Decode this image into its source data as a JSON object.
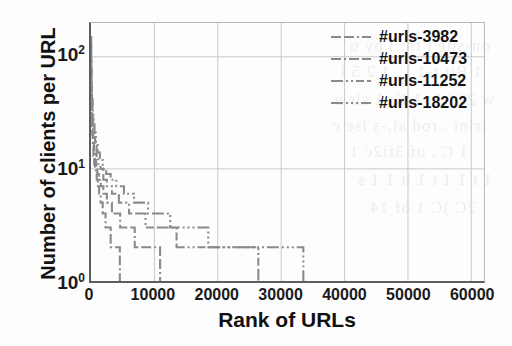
{
  "figure": {
    "background_color": "#fdfdfd",
    "axis_color": "#5e5e5e",
    "grid_color": "#c9c9c9",
    "line_color": "#8a8a8a"
  },
  "axes": {
    "xlabel": "Rank of URLs",
    "ylabel": "Number of clients per URL",
    "xticks": [
      "0",
      "10000",
      "20000",
      "30000",
      "40000",
      "50000",
      "60000"
    ],
    "xtick_values": [
      0,
      10000,
      20000,
      30000,
      40000,
      50000,
      60000
    ],
    "yticks": [
      "10",
      "10",
      "10"
    ],
    "ytick_exponents": [
      "0",
      "1",
      "2"
    ],
    "ytick_values": [
      1,
      10,
      100
    ]
  },
  "legend": {
    "position": "top-right",
    "entries": [
      {
        "label": "#urls-3982",
        "dash": "10,3,10,3,2,3",
        "color": "#8a8a8a"
      },
      {
        "label": "#urls-10473",
        "dash": "10,3,2,3,10,3",
        "color": "#8a8a8a"
      },
      {
        "label": "#urls-11252",
        "dash": "12,3,2,3,2,3,8,3",
        "color": "#8a8a8a"
      },
      {
        "label": "#urls-18202",
        "dash": "12,3,2,3,2,3,2,3",
        "color": "#8a8a8a"
      }
    ]
  },
  "chart_data": {
    "type": "line",
    "title": "",
    "xlabel": "Rank of URLs",
    "ylabel": "Number of clients per URL",
    "xlim": [
      0,
      62000
    ],
    "ylim": [
      1,
      200
    ],
    "yscale": "log",
    "xscale": "linear",
    "grid": true,
    "legend_position": "top-right",
    "note": "Four monotonically decreasing staircase (rank-frequency) curves. Each curve drops steeply from roughly 100 clients at rank 0 to 1 client at its terminal rank, stepping down through integer client counts.",
    "series": [
      {
        "name": "#urls-3982",
        "total_urls": 3982,
        "terminal_rank": 4600,
        "points": [
          [
            0,
            100
          ],
          [
            20,
            60
          ],
          [
            50,
            40
          ],
          [
            90,
            30
          ],
          [
            140,
            24
          ],
          [
            200,
            20
          ],
          [
            280,
            16
          ],
          [
            380,
            13
          ],
          [
            500,
            11
          ],
          [
            620,
            10
          ],
          [
            760,
            9
          ],
          [
            900,
            8
          ],
          [
            1080,
            7
          ],
          [
            1280,
            6
          ],
          [
            1520,
            5
          ],
          [
            1850,
            4
          ],
          [
            2300,
            3
          ],
          [
            3100,
            2
          ],
          [
            4550,
            1
          ],
          [
            4600,
            1
          ]
        ]
      },
      {
        "name": "#urls-10473",
        "total_urls": 10473,
        "terminal_rank": 11000,
        "points": [
          [
            0,
            110
          ],
          [
            25,
            65
          ],
          [
            60,
            45
          ],
          [
            110,
            33
          ],
          [
            170,
            26
          ],
          [
            250,
            21
          ],
          [
            350,
            17
          ],
          [
            470,
            14
          ],
          [
            620,
            12
          ],
          [
            800,
            10
          ],
          [
            1000,
            9
          ],
          [
            1250,
            8
          ],
          [
            1550,
            7
          ],
          [
            1950,
            6
          ],
          [
            2500,
            5
          ],
          [
            3300,
            4
          ],
          [
            4600,
            3
          ],
          [
            6900,
            2
          ],
          [
            10900,
            1
          ],
          [
            11000,
            1
          ]
        ]
      },
      {
        "name": "#urls-11252",
        "total_urls": 11252,
        "terminal_rank": 26500,
        "points": [
          [
            0,
            130
          ],
          [
            30,
            80
          ],
          [
            75,
            52
          ],
          [
            140,
            38
          ],
          [
            220,
            29
          ],
          [
            330,
            23
          ],
          [
            470,
            19
          ],
          [
            650,
            16
          ],
          [
            880,
            13
          ],
          [
            1150,
            11
          ],
          [
            1500,
            10
          ],
          [
            1950,
            8
          ],
          [
            2500,
            7
          ],
          [
            3300,
            6
          ],
          [
            4400,
            5
          ],
          [
            6000,
            4
          ],
          [
            8600,
            3
          ],
          [
            13500,
            2
          ],
          [
            26400,
            1
          ],
          [
            26500,
            1
          ]
        ]
      },
      {
        "name": "#urls-18202",
        "total_urls": 18202,
        "terminal_rank": 33600,
        "points": [
          [
            0,
            150
          ],
          [
            35,
            90
          ],
          [
            85,
            58
          ],
          [
            160,
            42
          ],
          [
            260,
            32
          ],
          [
            390,
            25
          ],
          [
            560,
            21
          ],
          [
            780,
            17
          ],
          [
            1050,
            14
          ],
          [
            1400,
            12
          ],
          [
            1850,
            10
          ],
          [
            2400,
            9
          ],
          [
            3100,
            8
          ],
          [
            4000,
            7
          ],
          [
            5200,
            6
          ],
          [
            6800,
            5
          ],
          [
            9000,
            4
          ],
          [
            12500,
            3
          ],
          [
            18500,
            2
          ],
          [
            33500,
            1
          ],
          [
            33600,
            1
          ]
        ]
      }
    ]
  },
  "ghost_text": [
    {
      "text": "on-site  t  th. )  by  u",
      "x": 22,
      "y": 36
    },
    {
      "text": "1 Bit  t-1 l  . 1 2 5  l",
      "x": 30,
      "y": 62
    },
    {
      "text": "w  2i)(  1. 1 K,  1 sir u",
      "x": 18,
      "y": 90
    },
    {
      "text": "trini  .  rod al,-s lse  c",
      "x": 26,
      "y": 116
    },
    {
      "text": "1  C  ,  of  3fi2c  1",
      "x": 44,
      "y": 142
    },
    {
      "text": "1 t  1 1  t  1  it  1  1 s",
      "x": 20,
      "y": 170
    },
    {
      "text": "2C )C  1  of  14",
      "x": 36,
      "y": 198
    }
  ]
}
